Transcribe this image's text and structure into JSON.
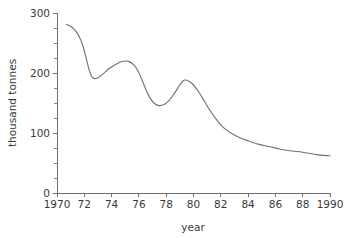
{
  "chart_data": {
    "type": "line",
    "title": "",
    "xlabel": "year",
    "ylabel": "thousand tonnes",
    "xlim": [
      1970,
      1990
    ],
    "ylim": [
      0,
      300
    ],
    "grid": false,
    "legend": null,
    "y_ticks": [
      0,
      100,
      200,
      300
    ],
    "y_tick_labels": [
      "0",
      "100",
      "200",
      "300"
    ],
    "y_minor_step": 25,
    "x_ticks": [
      1970,
      1972,
      1974,
      1976,
      1978,
      1980,
      1982,
      1984,
      1986,
      1988,
      1990
    ],
    "x_tick_labels": [
      "1970",
      "72",
      "74",
      "76",
      "78",
      "80",
      "82",
      "84",
      "86",
      "88",
      "1990"
    ],
    "line_color": "#737373",
    "axis_color": "#6e6e6e",
    "background_color": "#ffffff",
    "series": [
      {
        "name": "production",
        "x": [
          1970.7,
          1971.0,
          1971.3,
          1971.6,
          1971.9,
          1972.1,
          1972.3,
          1972.5,
          1972.7,
          1973.0,
          1973.4,
          1973.8,
          1974.2,
          1974.6,
          1975.0,
          1975.3,
          1975.6,
          1975.9,
          1976.2,
          1976.5,
          1976.8,
          1977.1,
          1977.4,
          1977.8,
          1978.2,
          1978.6,
          1979.0,
          1979.3,
          1979.7,
          1980.0,
          1980.4,
          1980.8,
          1981.2,
          1981.7,
          1982.2,
          1982.8,
          1983.4,
          1984.0,
          1984.8,
          1985.6,
          1986.4,
          1987.2,
          1988.0,
          1989.0,
          1990.0
        ],
        "y": [
          281,
          278,
          272,
          262,
          245,
          228,
          210,
          196,
          191,
          192,
          199,
          207,
          213,
          218,
          220,
          219,
          214,
          205,
          190,
          173,
          159,
          150,
          146,
          147,
          154,
          166,
          180,
          188,
          186,
          180,
          168,
          153,
          138,
          122,
          109,
          99,
          92,
          87,
          81,
          77,
          73,
          70,
          68,
          64,
          62
        ]
      }
    ],
    "annotations": []
  }
}
